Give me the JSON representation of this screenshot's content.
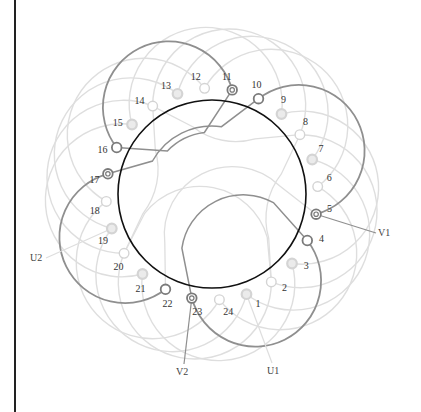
{
  "diagram": {
    "title": "",
    "type": "stator-winding-diagram",
    "slots": 24,
    "colors": {
      "stator_circle": "#111111",
      "active_winding": "#8f8f8f",
      "inactive_winding": "#dedede",
      "node_dark": "#7a7a7a",
      "node_light": "#d4d4d4",
      "frame": "#222222"
    },
    "slot_labels": [
      "1",
      "2",
      "3",
      "4",
      "5",
      "6",
      "7",
      "8",
      "9",
      "10",
      "11",
      "12",
      "13",
      "14",
      "15",
      "16",
      "17",
      "18",
      "19",
      "20",
      "21",
      "22",
      "23",
      "24"
    ],
    "terminals": {
      "U1": "U1",
      "U2": "U2",
      "V1": "V1",
      "V2": "V2"
    },
    "highlighted_slots": [
      "4",
      "5",
      "10",
      "11",
      "16",
      "17",
      "22",
      "23"
    ],
    "double_ring_slots": [
      "5",
      "11",
      "17",
      "23"
    ]
  }
}
